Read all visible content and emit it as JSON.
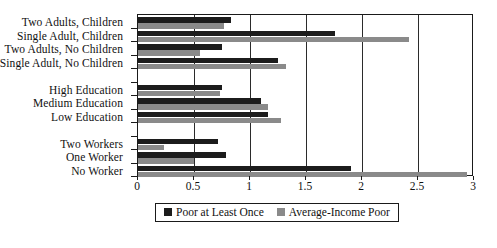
{
  "chart_data": {
    "type": "bar",
    "orientation": "horizontal",
    "title": "",
    "xlabel": "",
    "ylabel": "",
    "xlim": [
      0,
      3
    ],
    "grid": true,
    "legend_position": "bottom",
    "xticks": [
      "0",
      "0.5",
      "1",
      "1.5",
      "2",
      "2.5",
      "3"
    ],
    "xtick_values": [
      0,
      0.5,
      1,
      1.5,
      2,
      2.5,
      3
    ],
    "categories": [
      "Two Adults, Children",
      "Single Adult, Children",
      "Two Adults, No Children",
      "Single Adult, No Children",
      "",
      "High Education",
      "Medium Education",
      "Low Education",
      "",
      "Two Workers",
      "One Worker",
      "No Worker"
    ],
    "series": [
      {
        "name": "Poor at Least Once",
        "color": "#1c1c1c",
        "values": [
          0.83,
          1.76,
          0.75,
          1.25,
          null,
          0.75,
          1.1,
          1.16,
          null,
          0.71,
          0.79,
          1.9
        ]
      },
      {
        "name": "Average-Income Poor",
        "color": "#8a8a8a",
        "values": [
          0.77,
          2.42,
          0.55,
          1.32,
          null,
          0.73,
          1.16,
          1.28,
          null,
          0.23,
          0.5,
          2.94
        ]
      }
    ]
  },
  "legend": {
    "items": [
      {
        "label": "Poor at Least Once",
        "color": "#1c1c1c",
        "swatch": "square-dark-icon"
      },
      {
        "label": "Average-Income Poor",
        "color": "#8a8a8a",
        "swatch": "square-gray-icon"
      }
    ]
  }
}
